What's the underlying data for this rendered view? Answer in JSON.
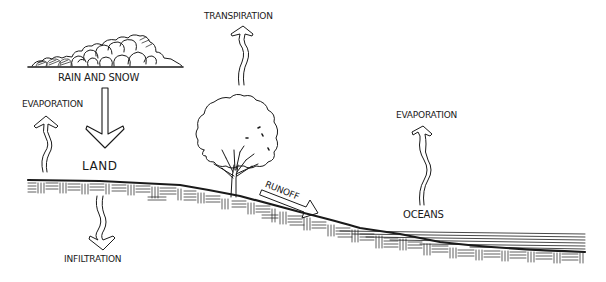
{
  "diagram": {
    "type": "water-cycle-illustration",
    "style": "hand-drawn pen sketch",
    "labels": {
      "rain_and_snow": "RAIN AND SNOW",
      "evaporation_land": "EVAPORATION",
      "land": "LAND",
      "infiltration": "INFILTRATION",
      "transpiration": "TRANSPIRATION",
      "runoff": "RUNOFF",
      "evaporation_ocean": "EVAPORATION",
      "oceans": "OCEANS"
    },
    "elements": {
      "cloud": "cloud",
      "tree": "tree",
      "ground": "land-profile",
      "water": "ocean"
    },
    "arrows": [
      {
        "name": "precipitation",
        "from": "cloud",
        "to": "land",
        "direction": "down"
      },
      {
        "name": "evaporation",
        "from": "land",
        "to": "air",
        "direction": "up"
      },
      {
        "name": "infiltration",
        "from": "land",
        "to": "ground",
        "direction": "down"
      },
      {
        "name": "transpiration",
        "from": "tree",
        "to": "air",
        "direction": "up"
      },
      {
        "name": "runoff",
        "from": "land",
        "to": "oceans",
        "direction": "down-slope"
      },
      {
        "name": "evaporation",
        "from": "oceans",
        "to": "air",
        "direction": "up"
      }
    ],
    "colors": {
      "ink": "#1a1a1a",
      "paper": "#ffffff"
    }
  }
}
